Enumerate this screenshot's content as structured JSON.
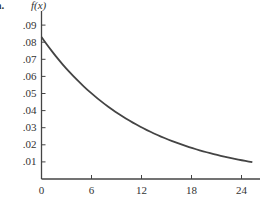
{
  "part_label": "a.",
  "chart_data": {
    "type": "line",
    "title": "",
    "xlabel": "",
    "ylabel": "f(x)",
    "xlim": [
      0,
      26
    ],
    "ylim": [
      0,
      0.095
    ],
    "x_ticks": [
      0,
      6,
      12,
      18,
      24
    ],
    "x_tick_labels": [
      "0",
      "6",
      "12",
      "18",
      "24"
    ],
    "y_ticks": [
      0.01,
      0.02,
      0.03,
      0.04,
      0.05,
      0.06,
      0.07,
      0.08,
      0.09
    ],
    "y_tick_labels": [
      ".01",
      ".02",
      ".03",
      ".04",
      ".05",
      ".06",
      ".07",
      ".08",
      ".09"
    ],
    "grid": false,
    "legend": null,
    "series": [
      {
        "name": "f(x)",
        "color": "#444444",
        "x": [
          0,
          3,
          6,
          9,
          12,
          15,
          18,
          21,
          24,
          25.3
        ],
        "y": [
          0.083,
          0.065,
          0.051,
          0.039,
          0.031,
          0.024,
          0.019,
          0.015,
          0.011,
          0.01
        ]
      }
    ]
  },
  "colors": {
    "axis": "#444444",
    "curve": "#444444",
    "text": "#333333"
  }
}
